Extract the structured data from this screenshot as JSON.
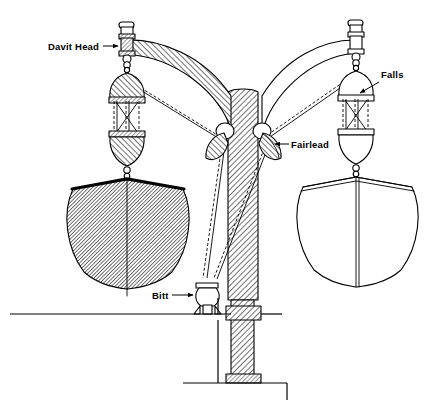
{
  "figure": {
    "background_color": "#ffffff",
    "line_color": "#000000",
    "width": 434,
    "height": 418
  },
  "callouts": [
    {
      "id": "davit-head",
      "label": "Davit Head",
      "text_x": 48,
      "text_y": 50,
      "anchor": "start",
      "leader_from_x": 103,
      "leader_from_y": 46,
      "leader_to_x": 121,
      "leader_to_y": 46,
      "arrow_direction": "right"
    },
    {
      "id": "falls",
      "label": "Falls",
      "text_x": 381,
      "text_y": 78,
      "anchor": "start",
      "leader_from_x": 378,
      "leader_from_y": 82,
      "leader_to_x": 357,
      "leader_to_y": 94,
      "arrow_direction": "left"
    },
    {
      "id": "fairlead",
      "label": "Fairlead",
      "text_x": 291,
      "text_y": 148,
      "anchor": "start",
      "leader_from_x": 289,
      "leader_from_y": 144,
      "leader_to_x": 272,
      "leader_to_y": 144,
      "arrow_direction": "left"
    },
    {
      "id": "bitt",
      "label": "Bitt",
      "text_x": 152,
      "text_y": 299,
      "anchor": "start",
      "leader_from_x": 172,
      "leader_from_y": 295,
      "leader_to_x": 196,
      "leader_to_y": 295,
      "arrow_direction": "right"
    }
  ],
  "parts": {
    "mast": "central-mast",
    "left_arm": "hatched-davit-arm-left",
    "right_arm": "outlined-davit-arm-right",
    "left_boat": "shaded-lifeboat-lowering",
    "right_boat": "outline-lifeboat-stowed",
    "left_block": "lower-and-upper-purchase-blocks",
    "right_block": "lower-and-upper-purchase-blocks",
    "bitt": "deck-bitt",
    "deck": "deck-line-and-base-plate"
  }
}
